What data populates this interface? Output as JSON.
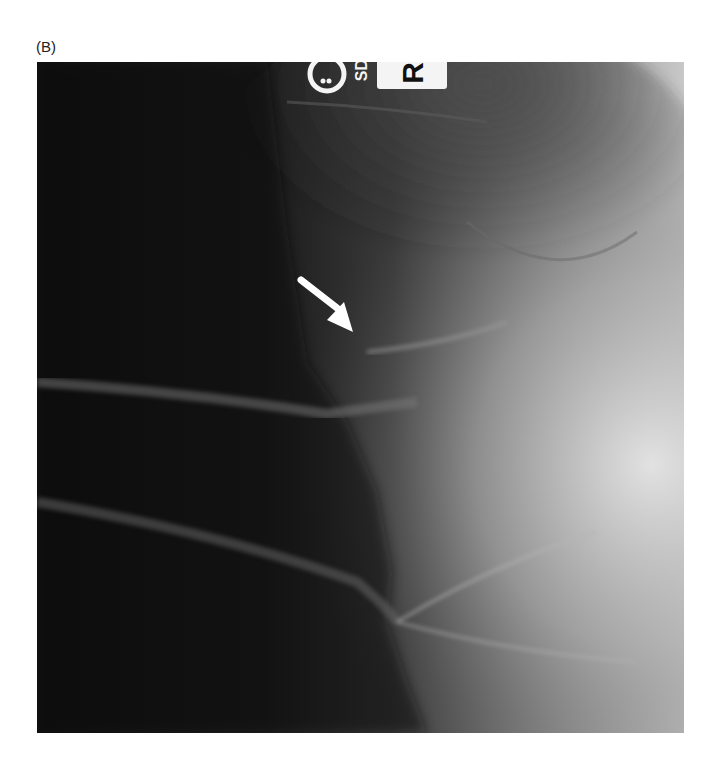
{
  "figure": {
    "panel_label": "(B)",
    "image": {
      "type": "radiograph",
      "markers": {
        "side_marker": "R",
        "tech_marker": "SD"
      },
      "annotation": "white-arrow",
      "colors": {
        "background": "#ffffff",
        "dark_field": "#0f0f0f",
        "bright_field": "#d8d8d8",
        "arrow": "#ffffff"
      }
    }
  }
}
